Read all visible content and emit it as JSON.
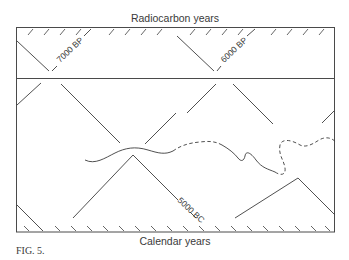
{
  "figure": {
    "top_axis_label": "Radiocarbon years",
    "bottom_axis_label": "Calendar years",
    "caption": "Fig. 5.",
    "caption_small_caps": "FIG. 5.",
    "labels": {
      "bp_7000": "7000 BP",
      "bp_6000": "6000 BP",
      "bc_5000": "5000 BC"
    }
  },
  "layout": {
    "upper_panel": "radiocarbon time scale with hatched top edge",
    "lower_panel": "calendar time scale with hatched bottom edge",
    "curve": "calibration curve: solid wiggly segments joined by dashed segments, looping at right"
  },
  "colors": {
    "ink": "#3c3c3c",
    "background": "#ffffff"
  }
}
